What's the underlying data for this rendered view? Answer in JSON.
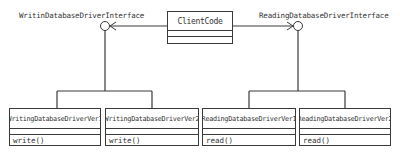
{
  "diagram": {
    "type": "UML class diagram",
    "interfaces": [
      {
        "id": "writing-interface",
        "label": "WritinDatabaseDriverInterface",
        "icon": "lollipop-interface-icon"
      },
      {
        "id": "reading-interface",
        "label": "ReadingDatabaseDriverInterface",
        "icon": "lollipop-interface-icon"
      }
    ],
    "client": {
      "name": "ClientCode"
    },
    "classes": [
      {
        "name": "WritingDatabaseDriverVer1",
        "operation": "write()"
      },
      {
        "name": "WritingDatabaseDriverVer2",
        "operation": "write()"
      },
      {
        "name": "ReadingDatabaseDriverVer1",
        "operation": "read()"
      },
      {
        "name": "ReadingDatabaseDriverVer2",
        "operation": "read()"
      }
    ],
    "colors": {
      "line": "#3a3a3a",
      "text": "#333333",
      "background": "#ffffff"
    }
  }
}
